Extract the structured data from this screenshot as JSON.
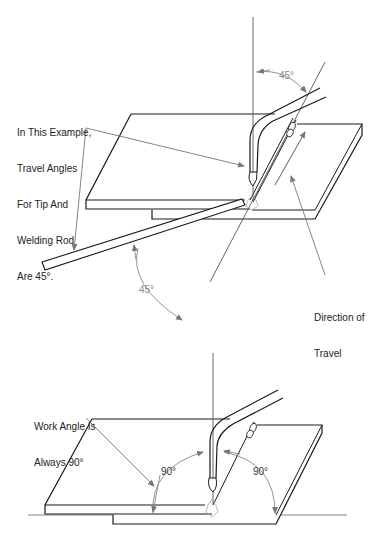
{
  "top_diagram": {
    "title": "Travel angle",
    "callout_travel_angles": [
      "In This Example,",
      "Travel Angles",
      "For Tip And",
      "Welding Rod",
      "Are 45°."
    ],
    "angle_tip": "45°",
    "angle_rod": "45°",
    "callout_direction": [
      "Direction of",
      "Travel"
    ]
  },
  "bottom_diagram": {
    "title": "Work angle",
    "callout_work_angle": [
      "Work Angle Is",
      "Always 90°"
    ],
    "angle_left": "90°",
    "angle_right": "90°"
  },
  "colors": {
    "line": "#1a1a1a",
    "guide": "#777777",
    "angle_text": "#888888",
    "background": "#ffffff"
  }
}
